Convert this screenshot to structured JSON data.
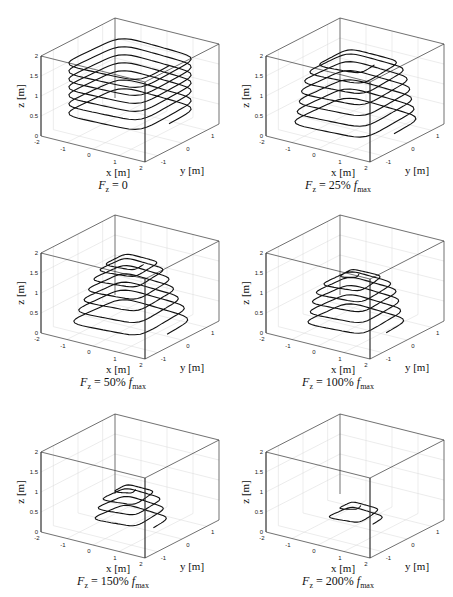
{
  "figure": {
    "panels": [
      {
        "id": "p1",
        "caption_var": "F",
        "caption_sub": "z",
        "caption_eq": " = ",
        "caption_val": "0",
        "caption_f": "",
        "caption_fsub": ""
      },
      {
        "id": "p2",
        "caption_var": "F",
        "caption_sub": "z",
        "caption_eq": " = ",
        "caption_val": "25% ",
        "caption_f": "f",
        "caption_fsub": "max"
      },
      {
        "id": "p3",
        "caption_var": "F",
        "caption_sub": "z",
        "caption_eq": " = ",
        "caption_val": "50% ",
        "caption_f": "f",
        "caption_fsub": "max"
      },
      {
        "id": "p4",
        "caption_var": "F",
        "caption_sub": "z",
        "caption_eq": " = ",
        "caption_val": "100% ",
        "caption_f": "f",
        "caption_fsub": "max"
      },
      {
        "id": "p5",
        "caption_var": "F",
        "caption_sub": "z",
        "caption_eq": " = ",
        "caption_val": "150% ",
        "caption_f": "f",
        "caption_fsub": "max"
      },
      {
        "id": "p6",
        "caption_var": "F",
        "caption_sub": "z",
        "caption_eq": " = ",
        "caption_val": "200% ",
        "caption_f": "f",
        "caption_fsub": "max"
      }
    ],
    "axes": {
      "xlabel": "x [m]",
      "ylabel": "y [m]",
      "zlabel": "z [m]",
      "xticks": [
        "-2",
        "-1",
        "0",
        "1",
        "2"
      ],
      "yticks": [
        "-1",
        "0",
        "1"
      ],
      "zticks": [
        "0",
        "0.5",
        "1",
        "1.5",
        "2"
      ]
    }
  },
  "chart_data": [
    {
      "type": "line3d",
      "title": "F_z = 0",
      "xlabel": "x [m]",
      "ylabel": "y [m]",
      "zlabel": "z [m]",
      "xlim": [
        -2,
        2
      ],
      "ylim": [
        -1.5,
        1.5
      ],
      "zlim": [
        0,
        2
      ],
      "grid": true,
      "description": "Square helical trajectory, constant size, ~7 loops from z≈0.4 to z≈1.85",
      "layers": [
        {
          "z": 0.4,
          "size": 1.0
        },
        {
          "z": 0.6,
          "size": 1.0
        },
        {
          "z": 0.85,
          "size": 1.0
        },
        {
          "z": 1.05,
          "size": 1.0
        },
        {
          "z": 1.25,
          "size": 1.0
        },
        {
          "z": 1.45,
          "size": 1.0
        },
        {
          "z": 1.65,
          "size": 1.0
        },
        {
          "z": 1.85,
          "size": 1.0
        }
      ]
    },
    {
      "type": "line3d",
      "title": "F_z = 25% f_max",
      "xlabel": "x [m]",
      "ylabel": "y [m]",
      "zlabel": "z [m]",
      "xlim": [
        -2,
        2
      ],
      "ylim": [
        -1.5,
        1.5
      ],
      "zlim": [
        0,
        2
      ],
      "grid": true,
      "description": "Square helix slightly shrinking with height, z≈0.1 to z≈1.75",
      "layers": [
        {
          "z": 0.15,
          "size": 1.0
        },
        {
          "z": 0.4,
          "size": 0.97
        },
        {
          "z": 0.65,
          "size": 0.93
        },
        {
          "z": 0.9,
          "size": 0.9
        },
        {
          "z": 1.15,
          "size": 0.86
        },
        {
          "z": 1.4,
          "size": 0.8
        },
        {
          "z": 1.6,
          "size": 0.7
        },
        {
          "z": 1.75,
          "size": 0.5
        }
      ]
    },
    {
      "type": "line3d",
      "title": "F_z = 50% f_max",
      "xlabel": "x [m]",
      "ylabel": "y [m]",
      "zlabel": "z [m]",
      "xlim": [
        -2,
        2
      ],
      "ylim": [
        -1.5,
        1.5
      ],
      "zlim": [
        0,
        2
      ],
      "grid": true,
      "description": "Helix tapering with height, z≈0.05 to z≈1.65",
      "layers": [
        {
          "z": 0.05,
          "size": 0.95
        },
        {
          "z": 0.35,
          "size": 0.9
        },
        {
          "z": 0.6,
          "size": 0.8
        },
        {
          "z": 0.85,
          "size": 0.72
        },
        {
          "z": 1.1,
          "size": 0.65
        },
        {
          "z": 1.35,
          "size": 0.55
        },
        {
          "z": 1.55,
          "size": 0.45
        },
        {
          "z": 1.65,
          "size": 0.35
        }
      ]
    },
    {
      "type": "line3d",
      "title": "F_z = 100% f_max",
      "xlabel": "x [m]",
      "ylabel": "y [m]",
      "zlabel": "z [m]",
      "xlim": [
        -2,
        2
      ],
      "ylim": [
        -1.5,
        1.5
      ],
      "zlim": [
        0,
        2
      ],
      "grid": true,
      "description": "Cone-shaped helix, z≈0.05 to z≈1.35",
      "layers": [
        {
          "z": 0.05,
          "size": 0.8
        },
        {
          "z": 0.3,
          "size": 0.75
        },
        {
          "z": 0.55,
          "size": 0.72
        },
        {
          "z": 0.8,
          "size": 0.68
        },
        {
          "z": 1.0,
          "size": 0.6
        },
        {
          "z": 1.2,
          "size": 0.45
        },
        {
          "z": 1.35,
          "size": 0.1
        }
      ]
    },
    {
      "type": "line3d",
      "title": "F_z = 150% f_max",
      "xlabel": "x [m]",
      "ylabel": "y [m]",
      "zlabel": "z [m]",
      "xlim": [
        -2,
        2
      ],
      "ylim": [
        -1.5,
        1.5
      ],
      "zlim": [
        0,
        2
      ],
      "grid": true,
      "description": "Short cone helix, z≈0.1 to z≈0.95",
      "layers": [
        {
          "z": 0.1,
          "size": 0.6
        },
        {
          "z": 0.35,
          "size": 0.55
        },
        {
          "z": 0.6,
          "size": 0.5
        },
        {
          "z": 0.8,
          "size": 0.4
        },
        {
          "z": 0.95,
          "size": 0.15
        }
      ]
    },
    {
      "type": "line3d",
      "title": "F_z = 200% f_max",
      "xlabel": "x [m]",
      "ylabel": "y [m]",
      "zlabel": "z [m]",
      "xlim": [
        -2,
        2
      ],
      "ylim": [
        -1.5,
        1.5
      ],
      "zlim": [
        0,
        2
      ],
      "grid": true,
      "description": "Low flat helix, z≈0.15 to z≈0.55",
      "layers": [
        {
          "z": 0.15,
          "size": 0.45
        },
        {
          "z": 0.35,
          "size": 0.4
        },
        {
          "z": 0.55,
          "size": 0.15
        }
      ]
    }
  ]
}
